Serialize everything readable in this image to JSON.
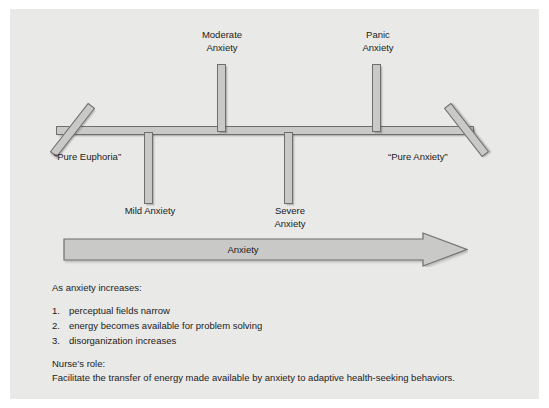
{
  "figure": {
    "background_color": "#e9e9e7",
    "bar_fill_color": "#c9c9c7",
    "bar_outline_color": "#6e6e6e"
  },
  "continuum": {
    "left_endpoint_label": "“Pure Euphoria”",
    "right_endpoint_label": "“Pure Anxiety”",
    "ticks": [
      {
        "id": "mild",
        "label": "Mild Anxiety",
        "direction": "down",
        "order": 1
      },
      {
        "id": "moderate",
        "label": "Moderate\nAnxiety",
        "direction": "up",
        "order": 2
      },
      {
        "id": "severe",
        "label": "Severe\nAnxiety",
        "direction": "down",
        "order": 3
      },
      {
        "id": "panic",
        "label": "Panic\nAnxiety",
        "direction": "up",
        "order": 4
      }
    ]
  },
  "arrow": {
    "label": "Anxiety",
    "direction": "right"
  },
  "notes": {
    "intro": "As anxiety increases:",
    "points": [
      {
        "number": "1.",
        "text": "perceptual fields narrow"
      },
      {
        "number": "2.",
        "text": "energy becomes available for problem solving"
      },
      {
        "number": "3.",
        "text": "disorganization increases"
      }
    ],
    "nurse_heading": "Nurse’s role:",
    "nurse_body": "Facilitate the transfer of energy made available by anxiety to adaptive health-seeking behaviors."
  }
}
